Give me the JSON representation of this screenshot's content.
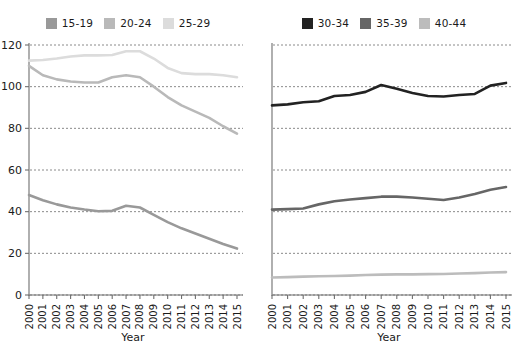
{
  "chart_data": [
    {
      "type": "line",
      "panel": "left",
      "title": "",
      "xlabel": "Year",
      "ylabel": "",
      "x": [
        2000,
        2001,
        2002,
        2003,
        2004,
        2005,
        2006,
        2007,
        2008,
        2009,
        2010,
        2011,
        2012,
        2013,
        2014,
        2015
      ],
      "xtick_labels": [
        "2000",
        "2001",
        "2002",
        "2003",
        "2004",
        "2005",
        "2006",
        "2007",
        "2008",
        "2009",
        "2010",
        "2011",
        "2012",
        "2013",
        "2014",
        "2015"
      ],
      "ytick_labels": [
        "0",
        "20",
        "40",
        "60",
        "80",
        "100",
        "120"
      ],
      "ylim": [
        0,
        120
      ],
      "ytick_step": 20,
      "grid": "horizontal-dashed",
      "legend_position": "top-center",
      "series": [
        {
          "name": "15-19",
          "color": "#999999",
          "values": [
            48.0,
            45.5,
            43.5,
            42.0,
            41.0,
            40.2,
            40.4,
            42.8,
            42.0,
            38.5,
            35.0,
            32.0,
            29.5,
            27.0,
            24.5,
            22.3
          ]
        },
        {
          "name": "20-24",
          "color": "#b9b9b9",
          "values": [
            110.0,
            105.5,
            103.5,
            102.5,
            102.0,
            102.0,
            104.5,
            105.5,
            104.5,
            100.0,
            95.0,
            91.0,
            88.0,
            85.0,
            81.0,
            77.5
          ]
        },
        {
          "name": "25-29",
          "color": "#dcdcdc",
          "values": [
            112.5,
            112.8,
            113.5,
            114.5,
            115.0,
            115.0,
            115.2,
            117.0,
            117.0,
            113.5,
            109.0,
            106.5,
            106.0,
            106.0,
            105.5,
            104.5
          ]
        }
      ]
    },
    {
      "type": "line",
      "panel": "right",
      "title": "",
      "xlabel": "Year",
      "ylabel": "",
      "x": [
        2000,
        2001,
        2002,
        2003,
        2004,
        2005,
        2006,
        2007,
        2008,
        2009,
        2010,
        2011,
        2012,
        2013,
        2014,
        2015
      ],
      "xtick_labels": [
        "2000",
        "2001",
        "2002",
        "2003",
        "2004",
        "2005",
        "2006",
        "2007",
        "2008",
        "2009",
        "2010",
        "2011",
        "2012",
        "2013",
        "2014",
        "2015"
      ],
      "ytick_labels": [],
      "ylim": [
        0,
        120
      ],
      "ytick_step": 20,
      "grid": "horizontal-dashed",
      "legend_position": "top-center",
      "series": [
        {
          "name": "30-34",
          "color": "#222222",
          "values": [
            91.0,
            91.5,
            92.5,
            93.0,
            95.5,
            96.0,
            97.5,
            100.8,
            99.0,
            97.0,
            95.5,
            95.3,
            96.0,
            96.5,
            100.5,
            101.8
          ]
        },
        {
          "name": "35-39",
          "color": "#666666",
          "values": [
            41.0,
            41.2,
            41.5,
            43.5,
            45.0,
            45.8,
            46.5,
            47.2,
            47.2,
            46.8,
            46.2,
            45.6,
            46.8,
            48.5,
            50.5,
            51.8
          ]
        },
        {
          "name": "40-44",
          "color": "#bcbcbc",
          "values": [
            8.4,
            8.6,
            8.8,
            9.0,
            9.1,
            9.3,
            9.6,
            9.8,
            9.9,
            9.9,
            10.0,
            10.1,
            10.3,
            10.5,
            10.8,
            11.0
          ]
        }
      ]
    }
  ],
  "legends": {
    "left": {
      "entries": [
        {
          "label": "15-19",
          "color": "#999999"
        },
        {
          "label": "20-24",
          "color": "#b9b9b9"
        },
        {
          "label": "25-29",
          "color": "#dcdcdc"
        }
      ]
    },
    "right": {
      "entries": [
        {
          "label": "30-34",
          "color": "#222222"
        },
        {
          "label": "35-39",
          "color": "#666666"
        },
        {
          "label": "40-44",
          "color": "#bcbcbc"
        }
      ]
    }
  }
}
